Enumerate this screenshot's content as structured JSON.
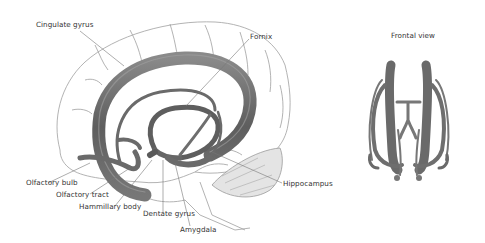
{
  "diagram": {
    "labels": {
      "cingulate_gyrus": "Cingulate gyrus",
      "fornix": "Fornix",
      "olfactory_bulb": "Olfactory bulb",
      "olfactory_tract": "Olfactory tract",
      "mammillary_body": "Hammillary body",
      "dentate_gyrus": "Dentate gyrus",
      "amygdala": "Amygdala",
      "hippocampus": "Hippocampus",
      "frontal_view": "Frontal view"
    },
    "colors": {
      "limbic_structure": "#6b6b6b",
      "limbic_highlight": "#9a9a9a",
      "brain_outline": "#9a9a9a",
      "cerebellum_fill": "#e6e6e6",
      "label_text": "#333333",
      "leader_line": "#777777"
    }
  }
}
